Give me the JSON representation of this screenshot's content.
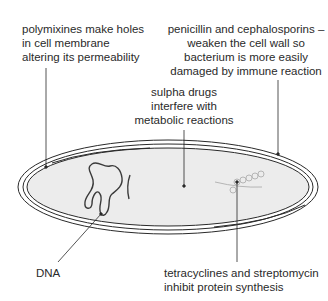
{
  "diagram": {
    "labels": {
      "polymixines": {
        "lines": [
          "polymixines make holes",
          "in cell membrane",
          "altering its permeability"
        ]
      },
      "penicillin": {
        "lines": [
          "penicillin and cephalosporins –",
          "weaken the cell wall so",
          "bacterium is more easily",
          "damaged by immune reaction"
        ]
      },
      "sulpha": {
        "lines": [
          "sulpha drugs",
          "interfere with",
          "metabolic reactions"
        ]
      },
      "dna": {
        "lines": [
          "DNA"
        ]
      },
      "tetracyclines": {
        "lines": [
          "tetracyclines and streptomycin",
          "inhibit protein synthesis"
        ]
      }
    },
    "parts": [
      "cell wall",
      "cell membrane",
      "cytoplasm",
      "DNA",
      "plasmid",
      "ribosomes on mRNA"
    ],
    "colors": {
      "outline": "#2a2a2a",
      "cytoplasm": "#ececec",
      "ribosome": "#b5b5b5",
      "background": "#ffffff"
    }
  }
}
